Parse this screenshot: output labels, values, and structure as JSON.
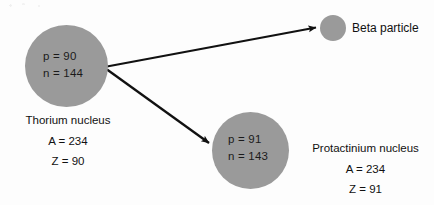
{
  "diagram": {
    "type": "nuclear-decay-diagram",
    "colors": {
      "nucleus_fill": "#9a9a9a",
      "arrow": "#111111",
      "text": "#111111",
      "background": "#fdfdfd"
    },
    "nuclei": [
      {
        "id": "thorium",
        "name": "Thorium nucleus",
        "inner": {
          "protons": "p = 90",
          "neutrons": "n = 144"
        },
        "mass_number": "A = 234",
        "atomic_number": "Z = 90"
      },
      {
        "id": "protactinium",
        "name": "Protactinium nucleus",
        "inner": {
          "protons": "p = 91",
          "neutrons": "n = 143"
        },
        "mass_number": "A = 234",
        "atomic_number": "Z = 91"
      }
    ],
    "emitted_particle": {
      "id": "beta",
      "label": "Beta particle"
    },
    "arrows": [
      {
        "id": "beta-emission-arrow",
        "from": "thorium",
        "to": "beta"
      },
      {
        "id": "daughter-nucleus-arrow",
        "from": "thorium",
        "to": "protactinium"
      }
    ]
  }
}
